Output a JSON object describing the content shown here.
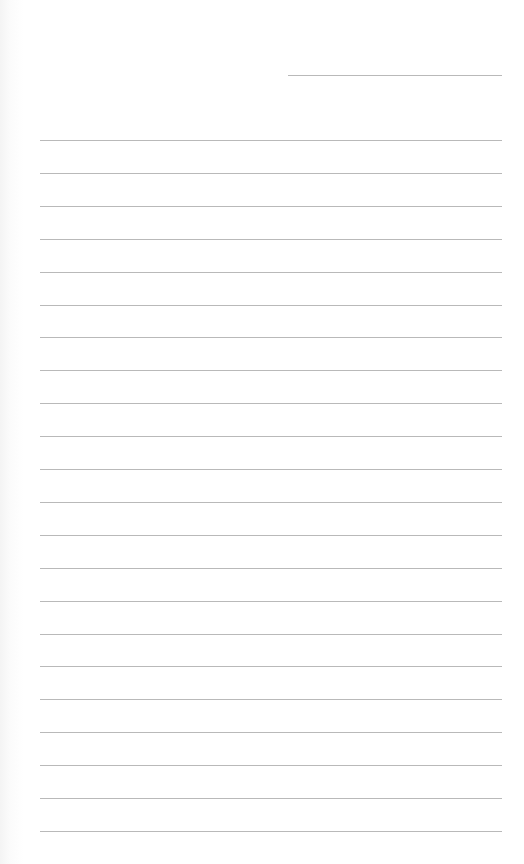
{
  "document": {
    "type": "lined-paper",
    "line_color": "#b9b9b9",
    "header_line": {
      "left": 288,
      "top": 75,
      "width": 214
    },
    "body_lines": {
      "count": 22,
      "left": 40,
      "width": 462,
      "first_top": 140,
      "spacing": 32.9
    }
  }
}
